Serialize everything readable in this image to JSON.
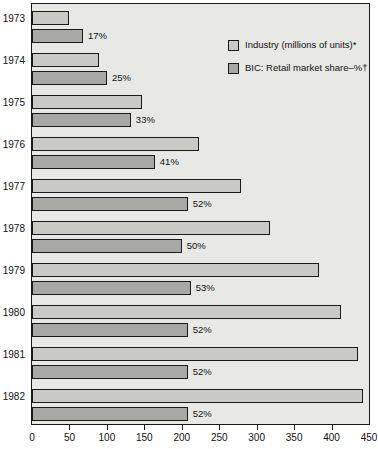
{
  "chart_data": {
    "type": "bar",
    "orientation": "horizontal",
    "title": "",
    "subtitle": "",
    "xlabel": "",
    "ylabel": "",
    "categories": [
      "1973",
      "1974",
      "1975",
      "1976",
      "1977",
      "1978",
      "1979",
      "1980",
      "1981",
      "1982"
    ],
    "xlim": [
      0,
      450
    ],
    "xticks": [
      0,
      50,
      100,
      150,
      200,
      250,
      300,
      350,
      400,
      450
    ],
    "xticklabels": [
      "0",
      "50",
      "100",
      "150",
      "200",
      "250",
      "300",
      "350",
      "400",
      "450"
    ],
    "grid": false,
    "legend_position": "top-right",
    "series": [
      {
        "name": "Industry (millions of units)*",
        "key": "industry",
        "color": "#c9c9c6",
        "values": [
          50,
          89,
          147,
          223,
          279,
          318,
          383,
          413,
          435,
          442
        ]
      },
      {
        "name": "BIC: Retail market share–%†",
        "key": "share",
        "color": "#a8a8a4",
        "values": [
          17,
          25,
          33,
          41,
          52,
          50,
          53,
          52,
          52,
          52
        ],
        "labels": [
          "17%",
          "25%",
          "33%",
          "41%",
          "52%",
          "50%",
          "53%",
          "52%",
          "52%",
          "52%"
        ],
        "plotted_scale": 4
      }
    ],
    "notes": ""
  },
  "legend": {
    "items": [
      {
        "label": "Industry (millions of units)*",
        "swatch": "industry"
      },
      {
        "label": "BIC: Retail market share–%†",
        "swatch": "share"
      }
    ]
  },
  "colors": {
    "plot_background": "#e8e8e6",
    "industry_bar": "#c9c9c6",
    "share_bar": "#a8a8a4",
    "axis": "#1a1a1a",
    "text": "#111111"
  }
}
